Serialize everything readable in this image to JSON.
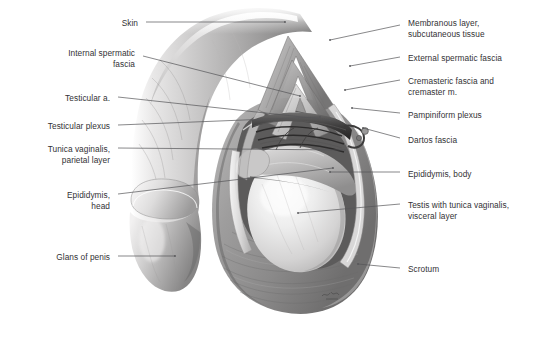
{
  "figure": {
    "style": "grayscale medical illustration",
    "background_color": "#ffffff",
    "label_color": "#333235",
    "leader_color": "#555558",
    "artist_signature": "Voll"
  },
  "labels_left": [
    {
      "id": "skin",
      "text": "Skin",
      "x": 138,
      "y": 18,
      "align": "right",
      "leader": [
        [
          146,
          22
        ],
        [
          285,
          22
        ]
      ]
    },
    {
      "id": "internal-spermatic-fascia",
      "text": "Internal spermatic\nfascia",
      "x": 135,
      "y": 48,
      "align": "right",
      "leader": [
        [
          143,
          56
        ],
        [
          300,
          96
        ]
      ]
    },
    {
      "id": "testicular-artery",
      "text": "Testicular a.",
      "x": 110,
      "y": 93,
      "align": "right",
      "leader": [
        [
          118,
          97
        ],
        [
          330,
          120
        ]
      ]
    },
    {
      "id": "testicular-plexus",
      "text": "Testicular plexus",
      "x": 110,
      "y": 121,
      "align": "right",
      "leader": [
        [
          118,
          125
        ],
        [
          320,
          117
        ]
      ]
    },
    {
      "id": "tunica-vaginalis-parietal",
      "text": "Tunica vaginalis,\nparietal layer",
      "x": 110,
      "y": 144,
      "align": "right",
      "leader": [
        [
          118,
          148
        ],
        [
          345,
          150
        ]
      ]
    },
    {
      "id": "epididymis-head",
      "text": "Epididymis,\nhead",
      "x": 110,
      "y": 190,
      "align": "right",
      "leader": [
        [
          118,
          194
        ],
        [
          333,
          168
        ]
      ]
    },
    {
      "id": "glans-of-penis",
      "text": "Glans of penis",
      "x": 110,
      "y": 252,
      "align": "right",
      "leader": [
        [
          118,
          256
        ],
        [
          175,
          256
        ]
      ]
    }
  ],
  "labels_right": [
    {
      "id": "membranous-layer",
      "text": "Membranous layer,\nsubcutaneous tissue",
      "x": 408,
      "y": 18,
      "align": "left",
      "leader": [
        [
          400,
          25
        ],
        [
          330,
          40
        ]
      ]
    },
    {
      "id": "external-spermatic-fascia",
      "text": "External spermatic fascia",
      "x": 408,
      "y": 53,
      "align": "left",
      "leader": [
        [
          400,
          57
        ],
        [
          350,
          66
        ]
      ]
    },
    {
      "id": "cremasteric-fascia",
      "text": "Cremasteric fascia and\ncremaster m.",
      "x": 408,
      "y": 76,
      "align": "left",
      "leader": [
        [
          400,
          80
        ],
        [
          345,
          90
        ]
      ]
    },
    {
      "id": "pampiniform-plexus",
      "text": "Pampiniform plexus",
      "x": 408,
      "y": 110,
      "align": "left",
      "leader": [
        [
          400,
          113
        ],
        [
          352,
          108
        ]
      ]
    },
    {
      "id": "dartos-fascia",
      "text": "Dartos fascia",
      "x": 408,
      "y": 135,
      "align": "left",
      "leader": [
        [
          400,
          138
        ],
        [
          363,
          128
        ]
      ]
    },
    {
      "id": "epididymis-body",
      "text": "Epididymis, body",
      "x": 408,
      "y": 169,
      "align": "left",
      "leader": [
        [
          400,
          172
        ],
        [
          330,
          172
        ]
      ]
    },
    {
      "id": "testis-tunica-vaginalis-visceral",
      "text": "Testis with tunica vaginalis,\nvisceral layer",
      "x": 408,
      "y": 200,
      "align": "left",
      "leader": [
        [
          400,
          204
        ],
        [
          298,
          213
        ]
      ]
    },
    {
      "id": "scrotum",
      "text": "Scrotum",
      "x": 408,
      "y": 264,
      "align": "left",
      "leader": [
        [
          400,
          268
        ],
        [
          358,
          264
        ]
      ]
    }
  ],
  "anatomy_regions": [
    {
      "id": "penis-shaft",
      "name": "Penis shaft"
    },
    {
      "id": "glans",
      "name": "Glans of penis"
    },
    {
      "id": "scrotum-sac",
      "name": "Scrotum"
    },
    {
      "id": "testis",
      "name": "Testis"
    },
    {
      "id": "epididymis",
      "name": "Epididymis"
    },
    {
      "id": "fascial-flaps",
      "name": "Reflected fascial flaps"
    },
    {
      "id": "spermatic-cord",
      "name": "Spermatic cord vessels"
    }
  ]
}
